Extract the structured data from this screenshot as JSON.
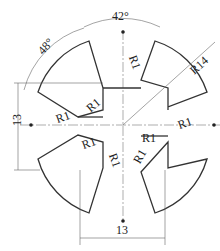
{
  "drawing": {
    "dimensions": {
      "angle_top": "42°",
      "angle_left": "48°",
      "radius_outer": "R14",
      "height": "13",
      "width": "13",
      "fillet_labels": [
        "R1",
        "R1",
        "R1",
        "R1",
        "R1",
        "R1",
        "R1",
        "R1"
      ]
    }
  }
}
